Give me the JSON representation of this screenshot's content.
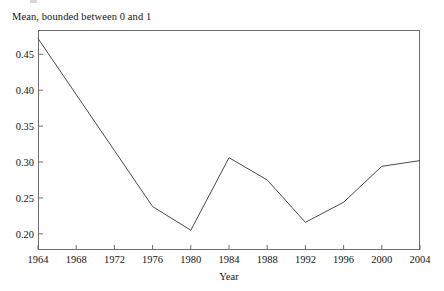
{
  "figure": {
    "y_axis_title": "Mean, bounded between 0 and 1",
    "x_axis_title": "Year"
  },
  "chart_data": {
    "type": "line",
    "title": "",
    "subtitle": "",
    "xlabel": "Year",
    "ylabel": "Mean, bounded between 0 and 1",
    "x": [
      1964,
      1968,
      1972,
      1976,
      1980,
      1984,
      1988,
      1992,
      1996,
      2000,
      2004
    ],
    "values": [
      0.472,
      0.394,
      0.316,
      0.238,
      0.205,
      0.306,
      0.275,
      0.216,
      0.244,
      0.294,
      0.302
    ],
    "series": [
      {
        "name": "Mean",
        "values": [
          0.472,
          0.394,
          0.316,
          0.238,
          0.205,
          0.306,
          0.275,
          0.216,
          0.244,
          0.294,
          0.302
        ]
      }
    ],
    "xlim": [
      1964,
      2004
    ],
    "ylim": [
      0.1775,
      0.4838
    ],
    "x_ticks": [
      1964,
      1968,
      1972,
      1976,
      1980,
      1984,
      1988,
      1992,
      1996,
      2000,
      2004
    ],
    "x_tick_labels": [
      "1964",
      "1968",
      "1972",
      "1976",
      "1980",
      "1984",
      "1988",
      "1992",
      "1996",
      "2000",
      "2004"
    ],
    "y_ticks": [
      0.2,
      0.25,
      0.3,
      0.35,
      0.4,
      0.45
    ],
    "y_tick_labels": [
      "0.20",
      "0.25",
      "0.30",
      "0.35",
      "0.40",
      "0.45"
    ],
    "grid": false,
    "legend": null,
    "legend_position": "none",
    "line_color": "#4a4a4a",
    "frame_color": "#6e6e6e",
    "annotations": []
  }
}
